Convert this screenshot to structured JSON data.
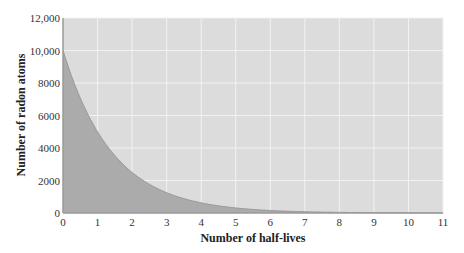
{
  "chart_data": {
    "type": "area",
    "title": "",
    "xlabel": "Number of half-lives",
    "ylabel": "Number of radon atoms",
    "x_ticks": [
      "0",
      "1",
      "2",
      "3",
      "4",
      "5",
      "6",
      "7",
      "8",
      "9",
      "10",
      "11"
    ],
    "y_ticks": [
      "0",
      "2000",
      "4000",
      "6000",
      "8000",
      "10,000",
      "12,000"
    ],
    "xlim": [
      0,
      11
    ],
    "ylim": [
      0,
      12000
    ],
    "grid": true,
    "legend": null,
    "series": [
      {
        "name": "Radon atoms remaining",
        "x": [
          0,
          0.5,
          1,
          1.5,
          2,
          2.5,
          3,
          3.5,
          4,
          4.5,
          5,
          5.5,
          6,
          6.5,
          7,
          7.5,
          8,
          8.5,
          9,
          9.5,
          10,
          10.5,
          11
        ],
        "values": [
          10000,
          7071,
          5000,
          3536,
          2500,
          1768,
          1250,
          884,
          625,
          442,
          313,
          221,
          156,
          110,
          78,
          55,
          39,
          28,
          20,
          14,
          10,
          7,
          5
        ]
      }
    ]
  },
  "colors": {
    "plot_bg": "#dcdcdc",
    "area_fill": "#ababab",
    "curve": "#999999",
    "grid": "#f2f2f2",
    "axis": "#9a9a9a"
  }
}
